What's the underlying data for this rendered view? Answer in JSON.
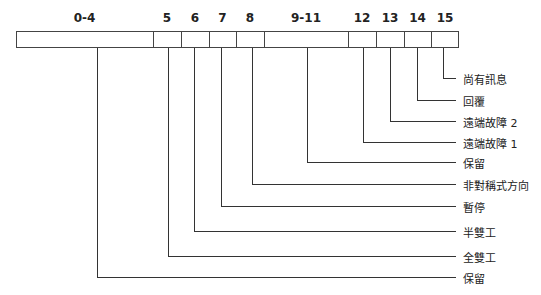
{
  "diagram": {
    "type": "bit-field register diagram",
    "line_color": "#333333",
    "fields": [
      {
        "bits": "0-4",
        "label": "保留",
        "x0": 16,
        "x1": 153,
        "drop_x": 97,
        "drop_y": 277
      },
      {
        "bits": "5",
        "label": "全雙工",
        "x0": 153,
        "x1": 181,
        "drop_x": 168,
        "drop_y": 256
      },
      {
        "bits": "6",
        "label": "半雙工",
        "x0": 181,
        "x1": 209,
        "drop_x": 194,
        "drop_y": 231
      },
      {
        "bits": "7",
        "label": "暫停",
        "x0": 209,
        "x1": 236,
        "drop_x": 221,
        "drop_y": 206
      },
      {
        "bits": "8",
        "label": "非對稱式方向",
        "x0": 236,
        "x1": 264,
        "drop_x": 252,
        "drop_y": 184
      },
      {
        "bits": "9-11",
        "label": "保留",
        "x0": 264,
        "x1": 348,
        "drop_x": 307,
        "drop_y": 162
      },
      {
        "bits": "12",
        "label": "遠端故障 1",
        "x0": 348,
        "x1": 376,
        "drop_x": 363,
        "drop_y": 142
      },
      {
        "bits": "13",
        "label": "遠端故障 2",
        "x0": 376,
        "x1": 404,
        "drop_x": 390,
        "drop_y": 121
      },
      {
        "bits": "14",
        "label": "回覆",
        "x0": 404,
        "x1": 431,
        "drop_x": 417,
        "drop_y": 100
      },
      {
        "bits": "15",
        "label": "尚有訊息",
        "x0": 431,
        "x1": 459,
        "drop_x": 443,
        "drop_y": 78
      }
    ]
  }
}
